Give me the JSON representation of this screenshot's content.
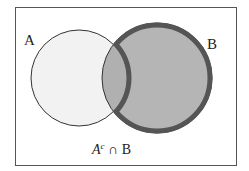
{
  "diagram": {
    "type": "venn",
    "sets": [
      {
        "label": "A",
        "fill": "#f2f2f2"
      },
      {
        "label": "B",
        "fill": "#b5b5b5"
      }
    ],
    "highlighted_region": "A^c ∩ B",
    "caption": {
      "base": "A",
      "sup": "c",
      "rest": " ∩ B"
    },
    "colors": {
      "frame": "#555555",
      "outline_thin": "#333333",
      "outline_thick": "#555555",
      "shade": "#b5b5b5"
    }
  }
}
